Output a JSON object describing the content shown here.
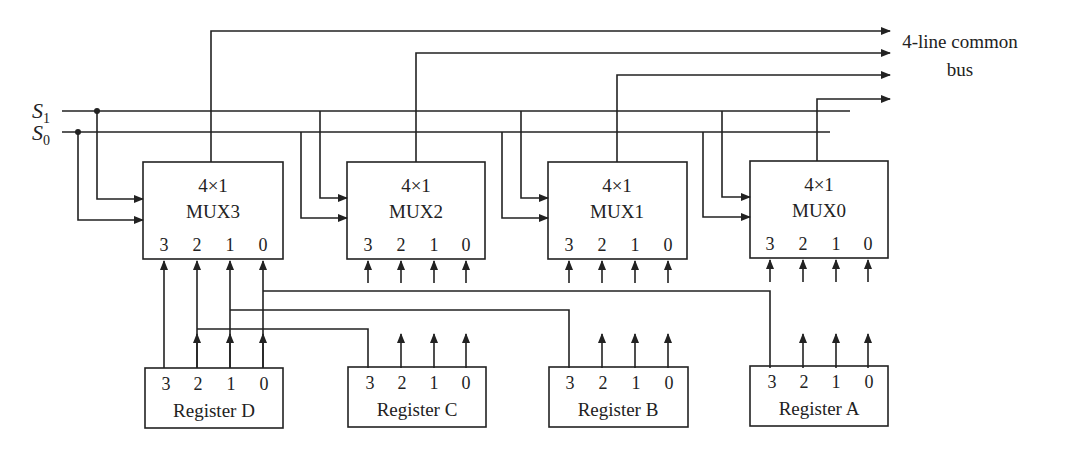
{
  "selects": {
    "s1": "S",
    "s1_sub": "1",
    "s0": "S",
    "s0_sub": "0"
  },
  "bus_label": {
    "line1": "4-line common",
    "line2": "bus"
  },
  "muxes": [
    {
      "type": "4×1",
      "name": "MUX3",
      "pins": [
        "3",
        "2",
        "1",
        "0"
      ]
    },
    {
      "type": "4×1",
      "name": "MUX2",
      "pins": [
        "3",
        "2",
        "1",
        "0"
      ]
    },
    {
      "type": "4×1",
      "name": "MUX1",
      "pins": [
        "3",
        "2",
        "1",
        "0"
      ]
    },
    {
      "type": "4×1",
      "name": "MUX0",
      "pins": [
        "3",
        "2",
        "1",
        "0"
      ]
    }
  ],
  "registers": [
    {
      "name": "Register D",
      "bits": [
        "3",
        "2",
        "1",
        "0"
      ]
    },
    {
      "name": "Register C",
      "bits": [
        "3",
        "2",
        "1",
        "0"
      ]
    },
    {
      "name": "Register B",
      "bits": [
        "3",
        "2",
        "1",
        "0"
      ]
    },
    {
      "name": "Register A",
      "bits": [
        "3",
        "2",
        "1",
        "0"
      ]
    }
  ]
}
